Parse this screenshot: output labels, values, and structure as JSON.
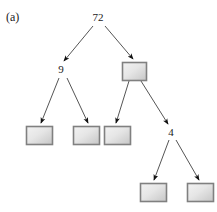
{
  "figure": {
    "panel_label": "(a)",
    "width": 217,
    "height": 212,
    "background_color": "#ffffff"
  },
  "style": {
    "edge_color": "#555555",
    "arrowhead_color": "#111111",
    "box_border_color": "#808080",
    "box_fill_light": "#eeeeee",
    "box_fill_dark": "#c8c8c8",
    "text_color": "#1a1a1a"
  },
  "tree": {
    "type": "binary-tree",
    "nodes": [
      {
        "id": "root",
        "kind": "text",
        "label": "72",
        "x": 98,
        "y": 18,
        "depth": 0
      },
      {
        "id": "n-9",
        "kind": "text",
        "label": "9",
        "x": 61,
        "y": 70,
        "depth": 1
      },
      {
        "id": "n-box-r1",
        "kind": "box",
        "label": "",
        "x": 134,
        "y": 71,
        "box_x": 122,
        "box_y": 62,
        "box_w": 24,
        "box_h": 18,
        "depth": 1
      },
      {
        "id": "leaf-1",
        "kind": "box",
        "label": "",
        "x": 39,
        "y": 135,
        "box_x": 26,
        "box_y": 126,
        "box_w": 26,
        "box_h": 18,
        "depth": 2
      },
      {
        "id": "leaf-2",
        "kind": "box",
        "label": "",
        "x": 86,
        "y": 135,
        "box_x": 73,
        "box_y": 126,
        "box_w": 26,
        "box_h": 18,
        "depth": 2
      },
      {
        "id": "leaf-3",
        "kind": "box",
        "label": "",
        "x": 117,
        "y": 135,
        "box_x": 104,
        "box_y": 126,
        "box_w": 26,
        "box_h": 18,
        "depth": 2
      },
      {
        "id": "n-4",
        "kind": "text",
        "label": "4",
        "x": 171,
        "y": 133,
        "depth": 2
      },
      {
        "id": "leaf-4",
        "kind": "box",
        "label": "",
        "x": 153,
        "y": 192,
        "box_x": 140,
        "box_y": 183,
        "box_w": 26,
        "box_h": 18,
        "depth": 3
      },
      {
        "id": "leaf-5",
        "kind": "box",
        "label": "",
        "x": 200,
        "y": 192,
        "box_x": 187,
        "box_y": 183,
        "box_w": 26,
        "box_h": 18,
        "depth": 3
      }
    ],
    "edges": [
      {
        "id": "edge-root-left",
        "from": "root",
        "to": "n-9",
        "x1": 93,
        "y1": 26,
        "x2": 64,
        "y2": 61
      },
      {
        "id": "edge-root-right",
        "from": "root",
        "to": "n-box-r1",
        "x1": 105,
        "y1": 26,
        "x2": 133,
        "y2": 59
      },
      {
        "id": "edge-9-left",
        "from": "n-9",
        "to": "leaf-1",
        "x1": 59,
        "y1": 78,
        "x2": 41,
        "y2": 123
      },
      {
        "id": "edge-9-right",
        "from": "n-9",
        "to": "leaf-2",
        "x1": 67,
        "y1": 78,
        "x2": 88,
        "y2": 123
      },
      {
        "id": "edge-box-left",
        "from": "n-box-r1",
        "to": "leaf-3",
        "x1": 129,
        "y1": 81,
        "x2": 116,
        "y2": 123
      },
      {
        "id": "edge-box-right",
        "from": "n-box-r1",
        "to": "n-4",
        "x1": 141,
        "y1": 81,
        "x2": 168,
        "y2": 124
      },
      {
        "id": "edge-4-left",
        "from": "n-4",
        "to": "leaf-4",
        "x1": 169,
        "y1": 140,
        "x2": 154,
        "y2": 180
      },
      {
        "id": "edge-4-right",
        "from": "n-4",
        "to": "leaf-5",
        "x1": 176,
        "y1": 140,
        "x2": 199,
        "y2": 180
      }
    ]
  }
}
